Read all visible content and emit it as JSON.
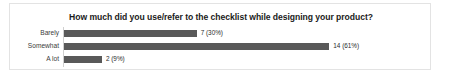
{
  "chart_data": {
    "type": "bar",
    "orientation": "horizontal",
    "title": "How much did you use/refer to the checklist while designing your product?",
    "xlabel": "",
    "ylabel": "",
    "grid": false,
    "legend": false,
    "axis_line": true,
    "xlim": [
      0,
      19
    ],
    "categories": [
      "Barely",
      "Somewhat",
      "A lot"
    ],
    "values": [
      7,
      14,
      2
    ],
    "percents": [
      30,
      61,
      9
    ],
    "data_labels": [
      "7 (30%)",
      "14 (61%)",
      "2 (9%)"
    ],
    "bar_color": "#595959",
    "background_color": "#ffffff",
    "border_color": "#e3e3e3",
    "title_color": "#1b1b1b",
    "label_color": "#3b3b3b"
  }
}
